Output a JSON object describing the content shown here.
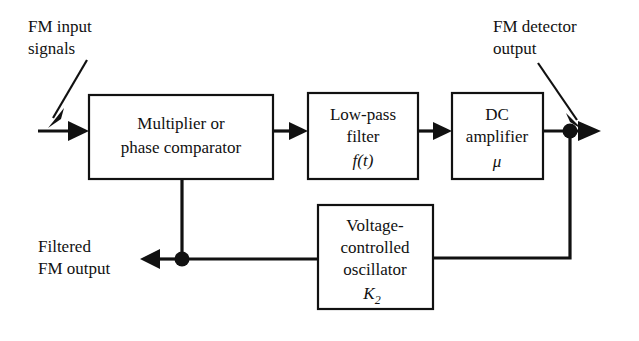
{
  "diagram": {
    "blocks": [
      {
        "id": "multiplier",
        "lines": [
          "Multiplier or",
          "phase comparator"
        ],
        "x": 89,
        "y": 95,
        "w": 184,
        "h": 84
      },
      {
        "id": "lowpass-filter",
        "lines": [
          "Low-pass",
          "filter"
        ],
        "math": "f(t)",
        "x": 308,
        "y": 93,
        "w": 110,
        "h": 86
      },
      {
        "id": "dc-amplifier",
        "lines": [
          "DC",
          "amplifier"
        ],
        "math": "μ",
        "x": 452,
        "y": 93,
        "w": 91,
        "h": 86
      },
      {
        "id": "vco",
        "lines": [
          "Voltage-",
          "controlled",
          "oscillator"
        ],
        "math_base": "K",
        "math_sub": "2",
        "x": 318,
        "y": 205,
        "w": 115,
        "h": 104
      }
    ],
    "annotations": [
      {
        "id": "fm-input",
        "lines": [
          "FM input",
          "signals"
        ],
        "x": 28,
        "y": 30
      },
      {
        "id": "fm-detector-output",
        "lines": [
          "FM detector",
          "output"
        ],
        "x": 493,
        "y": 30
      },
      {
        "id": "filtered-fm-output",
        "lines": [
          "Filtered",
          "FM output"
        ],
        "x": 38,
        "y": 248
      }
    ],
    "colors": {
      "line": "#111111",
      "background": "#ffffff",
      "text": "#111111"
    }
  }
}
